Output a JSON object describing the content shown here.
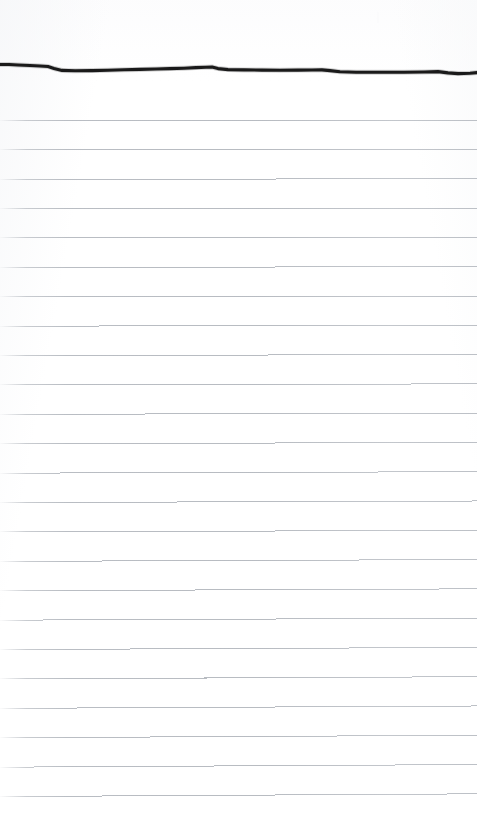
{
  "document": {
    "kind": "scanned-ruled-notepad-page",
    "title": "Blank lined notepad page",
    "page_width": 477,
    "page_height": 814,
    "background_color": "#ffffff",
    "body_text": "",
    "has_text_content": false,
    "handwriting_present": false,
    "margin_rule_present": false,
    "page_number": ""
  },
  "ink_stroke": {
    "label": "hand-drawn horizontal ink line",
    "color": "#111111",
    "stroke_width": 3.1,
    "start_x": 0,
    "end_x": 477,
    "baseline_y": 69,
    "path": "M 0,64.5 L 9,64.5 L 18,65 L 30,65.5 L 40,66 L 48,66.5 L 54,68.5 L 62,70.4 L 75,70.8 L 92,70.6 L 108,70.2 L 124,69.8 L 140,69.4 L 156,69.0 L 170,68.6 L 184,68.2 L 196,67.6 L 206,67.2 L 212,67.0 L 218,68.6 L 228,69.6 L 244,69.9 L 262,70.1 L 280,70.2 L 298,70.1 L 312,70.0 L 322,69.9 L 330,70.6 L 340,71.8 L 356,72.2 L 380,72.3 L 404,72.2 L 424,72.0 L 438,71.6 L 448,72.9 L 458,73.6 L 470,73.2 L 477,72.6"
  },
  "ruled_lines": {
    "label": "printed horizontal rules",
    "color": "#b9bdc3",
    "stroke_width": 1,
    "count": 25,
    "first_y": 91,
    "spacing": 29.3,
    "left_fade_px": 26,
    "tilt_px": 2.4,
    "y_positions": [
      91.0,
      120.3,
      149.6,
      178.9,
      208.2,
      237.5,
      266.8,
      296.1,
      325.4,
      354.7,
      384.0,
      413.3,
      442.6,
      471.9,
      501.2,
      530.5,
      559.8,
      589.1,
      618.4,
      647.7,
      677.0,
      706.3,
      735.6,
      764.9,
      794.2
    ]
  },
  "artifacts": {
    "faint_speck": {
      "x": 377,
      "y": 12,
      "color": "#fbfbfc"
    }
  }
}
